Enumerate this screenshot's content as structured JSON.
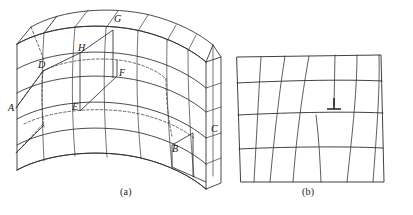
{
  "figure": {
    "panels": [
      {
        "id": "a",
        "caption": "(a)",
        "description": "Three-dimensional bent crystal block with a slipped region bounded by a dislocation line",
        "vertex_labels": [
          "A",
          "B",
          "C",
          "D",
          "E",
          "F",
          "G",
          "H"
        ],
        "labels": {
          "A": "A",
          "B": "B",
          "C": "C",
          "D": "D",
          "E": "E",
          "F": "F",
          "G": "G",
          "H": "H"
        }
      },
      {
        "id": "b",
        "caption": "(b)",
        "description": "Cross-section of the crystal showing the edge dislocation symbol",
        "symbol": "perpendicular-tack",
        "symbol_glyph": "⊥",
        "rows": 5,
        "columns": 6
      }
    ],
    "colors": {
      "line": "#2b2b2b",
      "dashed": "#3a3a3a",
      "label": "#111111",
      "background": "#ffffff"
    }
  }
}
